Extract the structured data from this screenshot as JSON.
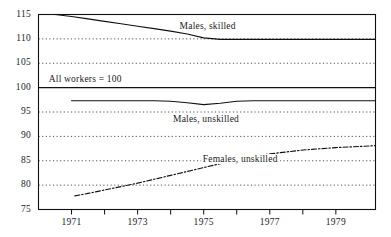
{
  "chart_data": {
    "type": "line",
    "title": "",
    "subtitle": "",
    "xlabel": "",
    "ylabel": "",
    "xlim": [
      1970.0,
      1980.2
    ],
    "ylim": [
      75,
      115
    ],
    "grid": true,
    "grid_style": "dotted",
    "baseline_value": 100,
    "legend": "inline-labels",
    "note": "All workers = 100",
    "yticks": [
      75,
      80,
      85,
      90,
      95,
      100,
      105,
      110,
      115
    ],
    "ytick_labels": [
      "75",
      "80",
      "85",
      "90",
      "95",
      "100",
      "105",
      "110",
      "115"
    ],
    "xticks": [
      1971,
      1972,
      1973,
      1974,
      1975,
      1976,
      1977,
      1978,
      1979
    ],
    "xtick_labels_shown": [
      "1971",
      "1973",
      "1975",
      "1977",
      "1979"
    ],
    "xtick_labels_positions": [
      1971,
      1973,
      1975,
      1977,
      1979
    ],
    "series": [
      {
        "name": "Males, skilled",
        "style": "solid",
        "x": [
          1970.0,
          1970.5,
          1971,
          1971.5,
          1972,
          1972.5,
          1973,
          1973.5,
          1974,
          1974.5,
          1975,
          1975.5,
          1976,
          1977,
          1978,
          1979,
          1980.2
        ],
        "values": [
          115.0,
          115.0,
          114.6,
          114.1,
          113.6,
          113.1,
          112.6,
          112.1,
          111.6,
          111.0,
          110.2,
          109.9,
          109.9,
          109.9,
          109.9,
          109.9,
          109.9
        ]
      },
      {
        "name": "Males, unskilled",
        "style": "solid",
        "x": [
          1971,
          1971.5,
          1972,
          1972.5,
          1973,
          1973.5,
          1974,
          1974.5,
          1975,
          1975.5,
          1976,
          1976.5,
          1977,
          1978,
          1979,
          1980.2
        ],
        "values": [
          97.3,
          97.3,
          97.3,
          97.3,
          97.3,
          97.3,
          97.2,
          96.9,
          96.5,
          96.8,
          97.2,
          97.3,
          97.3,
          97.3,
          97.3,
          97.3
        ]
      },
      {
        "name": "Females, unskilled",
        "style": "dash-dot",
        "x": [
          1971.1,
          1971.5,
          1972,
          1972.5,
          1973,
          1973.5,
          1974,
          1974.5,
          1975,
          1975.5,
          1976,
          1976.5,
          1977,
          1977.5,
          1978,
          1979,
          1980.2
        ],
        "values": [
          77.8,
          78.3,
          79.0,
          79.7,
          80.4,
          81.2,
          82.0,
          82.8,
          83.6,
          84.4,
          85.2,
          85.9,
          86.4,
          86.8,
          87.2,
          87.7,
          88.1
        ]
      }
    ],
    "series_label_positions": [
      {
        "name": "Males, skilled",
        "x": 1975.3,
        "y": 112.6
      },
      {
        "name": "Males, unskilled",
        "x": 1975.1,
        "y": 93.6
      },
      {
        "name": "Females, unskilled",
        "x": 1976.0,
        "y": 85.3
      }
    ],
    "note_position": {
      "x": 1970.25,
      "y": 101.8
    },
    "colors": {
      "axis": "#111111",
      "grid": "#555555",
      "series_males_skilled": "#1a1a1a",
      "series_males_unskilled": "#1a1a1a",
      "series_females_unskilled": "#1a1a1a",
      "background": "#ffffff"
    }
  }
}
